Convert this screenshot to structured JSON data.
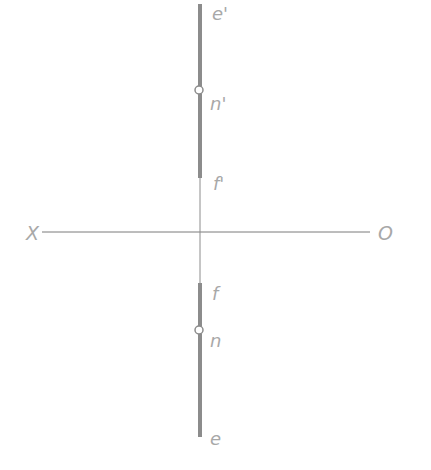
{
  "diagram": {
    "type": "orthographic projection of a line (point on line)",
    "colors": {
      "line": "#8c8c8c",
      "axis": "#7a7a7a",
      "label": "#a8a8a8",
      "background": "#ffffff"
    },
    "axis": {
      "left_label": "X",
      "right_label": "O"
    },
    "front_view": {
      "labels": {
        "top": "e'",
        "point": "n'",
        "bottom": "f'"
      }
    },
    "top_view": {
      "labels": {
        "top": "f",
        "point": "n",
        "bottom": "e"
      }
    }
  }
}
